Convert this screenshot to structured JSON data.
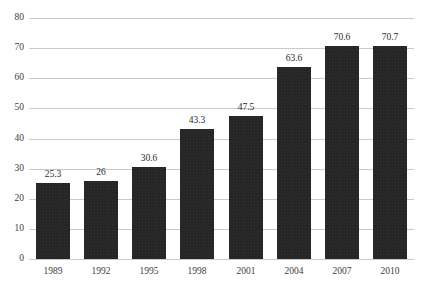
{
  "chart_data": {
    "type": "bar",
    "title": "",
    "subtitle": "",
    "xlabel": "",
    "ylabel": "",
    "categories": [
      "1989",
      "1992",
      "1995",
      "1998",
      "2001",
      "2004",
      "2007",
      "2010"
    ],
    "values": [
      25.3,
      26,
      30.6,
      43.3,
      47.5,
      63.6,
      70.6,
      70.7
    ],
    "value_labels": [
      "25.3",
      "26",
      "30.6",
      "43.3",
      "47.5",
      "63.6",
      "70.6",
      "70.7"
    ],
    "ylim": [
      0,
      80
    ],
    "ytick_values": [
      0,
      10,
      20,
      30,
      40,
      50,
      60,
      70,
      80
    ],
    "ytick_labels": [
      "0",
      "10",
      "20",
      "30",
      "40",
      "50",
      "60",
      "70",
      "80"
    ],
    "grid": "horizontal",
    "legend": "none",
    "bar_color": "#262626",
    "gridline_color": "#c9c9c9",
    "background_color": "#ffffff",
    "text_color": "#3d3d3d"
  }
}
